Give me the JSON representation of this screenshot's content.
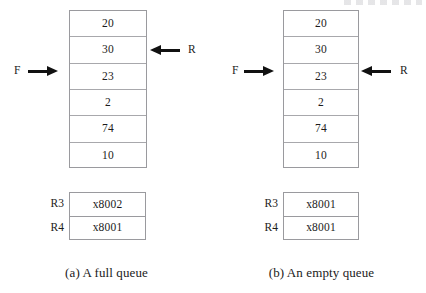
{
  "figure": {
    "pointer_labels": {
      "front": "F",
      "rear": "R"
    },
    "icons": {
      "arrow_right": "arrow-right-icon",
      "arrow_left": "arrow-left-icon"
    },
    "colors": {
      "arrow": "#111111",
      "border": "#9a9a9e",
      "cell_divider": "#a8a8ac",
      "text": "#1b1b1b",
      "background": "#ffffff"
    },
    "panels": [
      {
        "id": "full-queue",
        "caption": "(a) A full queue",
        "queue_cells": [
          "20",
          "30",
          "23",
          "2",
          "74",
          "10"
        ],
        "front_pointer": {
          "label": "F",
          "direction": "right",
          "target_cell_index": 2
        },
        "rear_pointer": {
          "label": "R",
          "direction": "left",
          "target_cell_index": 1
        },
        "registers": [
          {
            "name": "R3",
            "value": "x8002"
          },
          {
            "name": "R4",
            "value": "x8001"
          }
        ]
      },
      {
        "id": "empty-queue",
        "caption": "(b) An empty queue",
        "queue_cells": [
          "20",
          "30",
          "23",
          "2",
          "74",
          "10"
        ],
        "front_pointer": {
          "label": "F",
          "direction": "right",
          "target_cell_index": 2
        },
        "rear_pointer": {
          "label": "R",
          "direction": "left",
          "target_cell_index": 2
        },
        "registers": [
          {
            "name": "R3",
            "value": "x8001"
          },
          {
            "name": "R4",
            "value": "x8001"
          }
        ]
      }
    ]
  }
}
